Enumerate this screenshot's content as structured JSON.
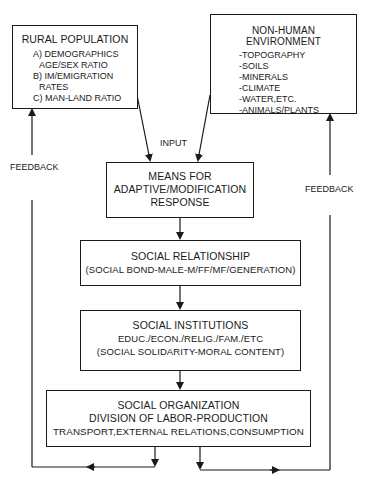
{
  "diagram": {
    "rural_population": {
      "title": "RURAL POPULATION",
      "items": [
        "A) DEMOGRAPHICS",
        "AGE/SEX RATIO",
        "B)  IM/EMIGRATION",
        "RATES",
        "C)  MAN-LAND RATIO"
      ]
    },
    "non_human_environment": {
      "title": "NON-HUMAN ENVIRONMENT",
      "items": [
        "-TOPOGRAPHY",
        "-SOILS",
        "-MINERALS",
        "-CLIMATE",
        "-WATER,ETC.",
        "-ANIMALS/PLANTS"
      ]
    },
    "input_label": "INPUT",
    "feedback_left": "FEEDBACK",
    "feedback_right": "FEEDBACK",
    "means": {
      "lines": [
        "MEANS FOR",
        "ADAPTIVE/MODIFICATION",
        "RESPONSE"
      ]
    },
    "social_relationship": {
      "lines": [
        "SOCIAL RELATIONSHIP",
        "(SOCIAL BOND-MALE-M/FF/MF/GENERATION)"
      ]
    },
    "social_institutions": {
      "lines": [
        "SOCIAL INSTITUTIONS",
        "EDUC./ECON./RELIG./FAM./ETC",
        "(SOCIAL SOLIDARITY-MORAL CONTENT)"
      ]
    },
    "social_organization": {
      "lines": [
        "SOCIAL ORGANIZATION",
        "DIVISION OF LABOR-PRODUCTION",
        "TRANSPORT,EXTERNAL RELATIONS,CONSUMPTION"
      ]
    }
  }
}
